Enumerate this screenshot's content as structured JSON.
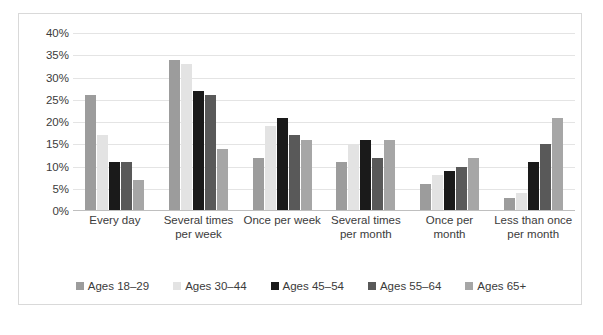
{
  "chart_data": {
    "type": "bar",
    "title": "",
    "xlabel": "",
    "ylabel": "",
    "ylim": [
      0,
      40
    ],
    "ytick_values": [
      40,
      35,
      30,
      25,
      20,
      15,
      10,
      5,
      0
    ],
    "ytick_labels": [
      "40%",
      "35%",
      "30%",
      "25%",
      "20%",
      "15%",
      "10%",
      "5%",
      "0%"
    ],
    "grid": true,
    "legend_position": "bottom",
    "categories": [
      "Every day",
      "Several times per week",
      "Once per week",
      "Several times per month",
      "Once per month",
      "Less than once per month"
    ],
    "series": [
      {
        "name": "Ages 18–29",
        "color": "#9c9c9c",
        "values": [
          26,
          34,
          12,
          11,
          6,
          3
        ]
      },
      {
        "name": "Ages 30–44",
        "color": "#e3e3e3",
        "values": [
          17,
          33,
          19,
          15,
          8,
          4
        ]
      },
      {
        "name": "Ages 45–54",
        "color": "#1a1a1a",
        "values": [
          11,
          27,
          21,
          16,
          9,
          11
        ]
      },
      {
        "name": "Ages 55–64",
        "color": "#595959",
        "values": [
          11,
          26,
          17,
          12,
          10,
          15
        ]
      },
      {
        "name": "Ages 65+",
        "color": "#a6a6a6",
        "values": [
          7,
          14,
          16,
          16,
          12,
          21
        ]
      }
    ]
  },
  "caption": {
    "text": ""
  }
}
